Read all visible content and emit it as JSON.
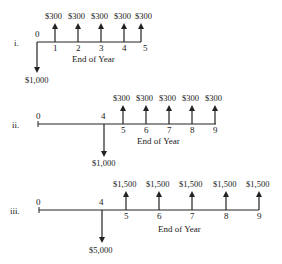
{
  "diagrams": [
    {
      "label": "i.",
      "axis_caption": "End of Year",
      "start_label": "0",
      "outflow": {
        "year": 0,
        "amount": "$1,000"
      },
      "inflows": [
        {
          "year": "1",
          "amount": "$300"
        },
        {
          "year": "2",
          "amount": "$300"
        },
        {
          "year": "3",
          "amount": "$300"
        },
        {
          "year": "4",
          "amount": "$300"
        },
        {
          "year": "5",
          "amount": "$300"
        }
      ]
    },
    {
      "label": "ii.",
      "axis_caption": "End of Year",
      "start_label": "0",
      "outflow": {
        "year": "4",
        "amount": "$1,000"
      },
      "inflows": [
        {
          "year": "5",
          "amount": "$300"
        },
        {
          "year": "6",
          "amount": "$300"
        },
        {
          "year": "7",
          "amount": "$300"
        },
        {
          "year": "8",
          "amount": "$300"
        },
        {
          "year": "9",
          "amount": "$300"
        }
      ]
    },
    {
      "label": "iii.",
      "axis_caption": "End of Year",
      "start_label": "0",
      "outflow": {
        "year": "4",
        "amount": "$5,000"
      },
      "inflows": [
        {
          "year": "5",
          "amount": "$1,500"
        },
        {
          "year": "6",
          "amount": "$1,500"
        },
        {
          "year": "7",
          "amount": "$1,500"
        },
        {
          "year": "8",
          "amount": "$1,500"
        },
        {
          "year": "9",
          "amount": "$1,500"
        }
      ]
    }
  ]
}
